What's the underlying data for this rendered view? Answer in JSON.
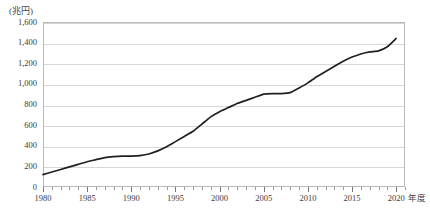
{
  "chart_data": {
    "type": "line",
    "title": "",
    "subtitle": "",
    "xlabel": "年度",
    "ylabel": "(兆円)",
    "unit_label": "(兆円)",
    "x_axis_unit_suffix": "年度",
    "grid": true,
    "legend": false,
    "legend_position": "none",
    "xlim": [
      1980,
      2021
    ],
    "ylim": [
      0,
      1600
    ],
    "y_tick_labels": [
      "1,600",
      "1,400",
      "1,200",
      "1,000",
      "800",
      "600",
      "400",
      "200",
      "0"
    ],
    "y_tick_values": [
      1600,
      1400,
      1200,
      1000,
      800,
      600,
      400,
      200,
      0
    ],
    "x_tick_labels": [
      "1980",
      "1985",
      "1990",
      "1995",
      "2000",
      "2005",
      "2010",
      "2015",
      "2020"
    ],
    "x_tick_values": [
      1980,
      1985,
      1990,
      1995,
      2000,
      2005,
      2010,
      2015,
      2020
    ],
    "x_minor_tick_step": 1,
    "series": [
      {
        "name": "国債残高",
        "color": "#231f20",
        "x": [
          1980,
          1981,
          1982,
          1983,
          1984,
          1985,
          1986,
          1987,
          1988,
          1989,
          1990,
          1991,
          1992,
          1993,
          1994,
          1995,
          1996,
          1997,
          1998,
          1999,
          2000,
          2001,
          2002,
          2003,
          2004,
          2005,
          2006,
          2007,
          2008,
          2009,
          2010,
          2011,
          2012,
          2013,
          2014,
          2015,
          2016,
          2017,
          2018,
          2019,
          2020
        ],
        "values": [
          120,
          145,
          170,
          195,
          220,
          245,
          265,
          285,
          295,
          300,
          300,
          305,
          320,
          350,
          390,
          440,
          490,
          540,
          610,
          680,
          730,
          770,
          810,
          840,
          870,
          900,
          905,
          905,
          915,
          960,
          1010,
          1070,
          1120,
          1170,
          1220,
          1260,
          1290,
          1310,
          1320,
          1360,
          1440
        ]
      }
    ]
  },
  "axis": {
    "unit_label": "(兆円)",
    "x_unit_suffix": "年度"
  }
}
